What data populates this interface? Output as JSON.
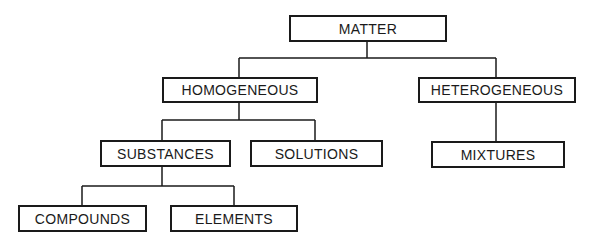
{
  "diagram": {
    "type": "tree",
    "nodes": {
      "matter": "MATTER",
      "homogeneous": "HOMOGENEOUS",
      "heterogeneous": "HETEROGENEOUS",
      "substances": "SUBSTANCES",
      "solutions": "SOLUTIONS",
      "mixtures": "MIXTURES",
      "compounds": "COMPOUNDS",
      "elements": "ELEMENTS"
    },
    "edges": [
      [
        "MATTER",
        "HOMOGENEOUS"
      ],
      [
        "MATTER",
        "HETEROGENEOUS"
      ],
      [
        "HOMOGENEOUS",
        "SUBSTANCES"
      ],
      [
        "HOMOGENEOUS",
        "SOLUTIONS"
      ],
      [
        "HETEROGENEOUS",
        "MIXTURES"
      ],
      [
        "SUBSTANCES",
        "COMPOUNDS"
      ],
      [
        "SUBSTANCES",
        "ELEMENTS"
      ]
    ]
  }
}
